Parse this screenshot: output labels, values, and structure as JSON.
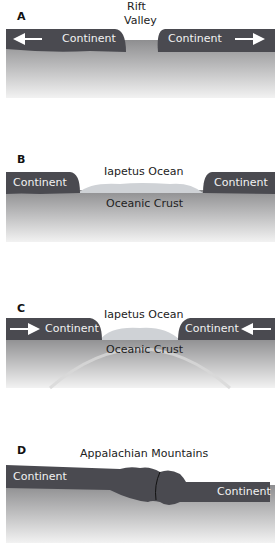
{
  "panels": [
    {
      "id": "A",
      "labels": {
        "top": "Rift",
        "top2": "Valley",
        "left": "Continent",
        "right": "Continent"
      },
      "arrows": "outward"
    },
    {
      "id": "B",
      "labels": {
        "ocean": "Iapetus Ocean",
        "crust": "Oceanic Crust",
        "left": "Continent",
        "right": "Continent"
      }
    },
    {
      "id": "C",
      "labels": {
        "ocean": "Iapetus Ocean",
        "crust": "Oceanic Crust",
        "left": "Continent",
        "right": "Continent"
      },
      "arrows": "inward"
    },
    {
      "id": "D",
      "labels": {
        "title": "Appalachian Mountains",
        "left": "Continent",
        "right": "Continent"
      }
    }
  ],
  "colors": {
    "continent": "#4a4a50",
    "mantle_top": "#8e8e90",
    "mantle_bottom": "#f0f0f0",
    "ocean": "#cfd2d6"
  }
}
